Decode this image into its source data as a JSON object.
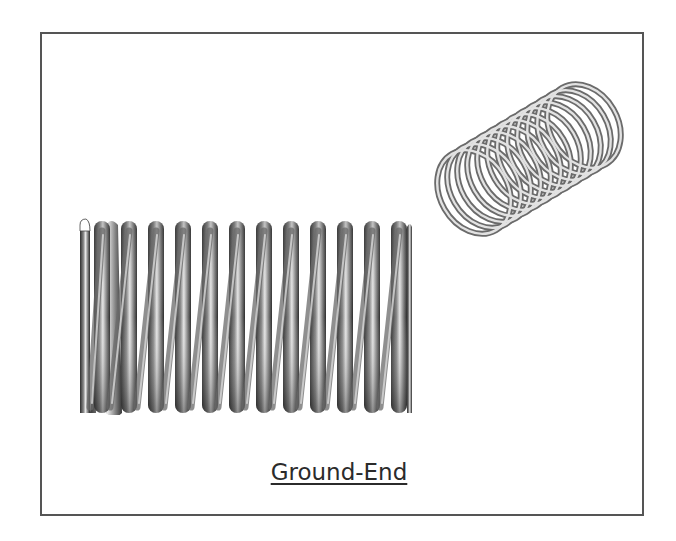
{
  "figure": {
    "caption": "Ground-End",
    "frame_color": "#555555",
    "side_view": {
      "label": "side-view-spring",
      "coil_count_top": 12,
      "coil_count_bottom": 12,
      "end_type": "ground"
    },
    "iso_view": {
      "label": "isometric-spring",
      "coil_count": 14
    }
  }
}
